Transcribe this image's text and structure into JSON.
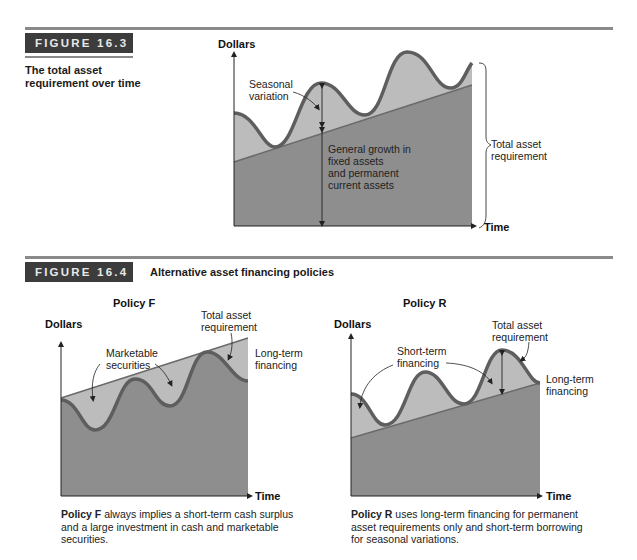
{
  "figure_16_3": {
    "badge": "FIGURE 16.3",
    "caption_line1": "The total asset",
    "caption_line2": "requirement over time",
    "y_axis_label": "Dollars",
    "x_axis_label": "Time",
    "annotation_seasonal_1": "Seasonal",
    "annotation_seasonal_2": "variation",
    "annotation_growth_1": "General growth in",
    "annotation_growth_2": "fixed assets",
    "annotation_growth_3": "and permanent",
    "annotation_growth_4": "current assets",
    "annotation_total_1": "Total asset",
    "annotation_total_2": "requirement"
  },
  "figure_16_4": {
    "badge": "FIGURE 16.4",
    "title": "Alternative asset financing policies",
    "policy_f": {
      "title": "Policy F",
      "y_axis_label": "Dollars",
      "x_axis_label": "Time",
      "annotation_total_1": "Total asset",
      "annotation_total_2": "requirement",
      "annotation_marketable_1": "Marketable",
      "annotation_marketable_2": "securities",
      "annotation_longterm_1": "Long-term",
      "annotation_longterm_2": "financing",
      "note_bold": "Policy F",
      "note_line1": " always implies a short-term cash surplus",
      "note_line2": "and a large investment in cash and marketable",
      "note_line3": "securities."
    },
    "policy_r": {
      "title": "Policy R",
      "y_axis_label": "Dollars",
      "x_axis_label": "Time",
      "annotation_total_1": "Total asset",
      "annotation_total_2": "requirement",
      "annotation_shortterm_1": "Short-term",
      "annotation_shortterm_2": "financing",
      "annotation_longterm_1": "Long-term",
      "annotation_longterm_2": "financing",
      "note_bold": "Policy R",
      "note_line1": " uses long-term financing for permanent",
      "note_line2": "asset requirements only and short-term borrowing",
      "note_line3": "for seasonal variations."
    }
  },
  "colors": {
    "dark_fill": "#8e8e8e",
    "light_fill": "#b9b9b9",
    "wave_stroke": "#5e5e5e",
    "badge_bg": "#3c3c3c",
    "rule": "#8a8a8a"
  }
}
